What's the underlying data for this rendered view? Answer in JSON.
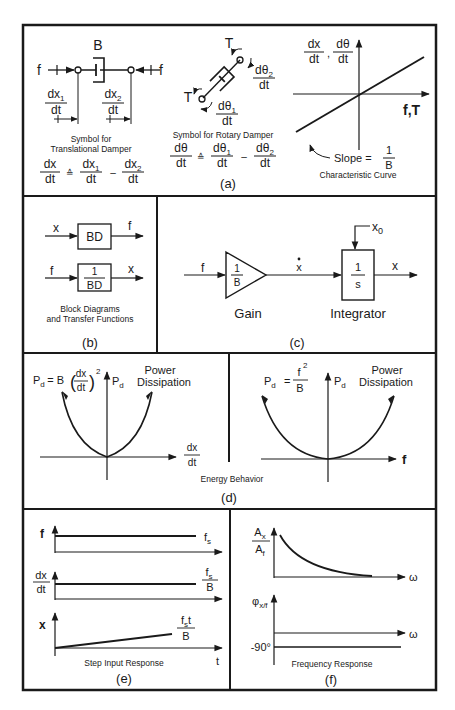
{
  "figure": {
    "panels": {
      "a": {
        "label": "(a)",
        "translational": {
          "damper_label": "B",
          "force_left": "f",
          "force_right": "f",
          "vel1_num": "dx",
          "vel1_sub": "1",
          "vel1_den": "dt",
          "vel2_num": "dx",
          "vel2_sub": "2",
          "vel2_den": "dt",
          "caption_line1": "Symbol for",
          "caption_line2": "Translational Damper",
          "eq_lhs_num": "dx",
          "eq_lhs_den": "dt",
          "eq_sign": "≙",
          "eq_t1_num": "dx",
          "eq_t1_sub": "1",
          "eq_t1_den": "dt",
          "eq_minus": "–",
          "eq_t2_num": "dx",
          "eq_t2_sub": "2",
          "eq_t2_den": "dt"
        },
        "rotary": {
          "torque_top": "T",
          "torque_bottom": "T",
          "vel2_num": "dθ",
          "vel2_sub": "2",
          "vel2_den": "dt",
          "vel1_num": "dθ",
          "vel1_sub": "1",
          "vel1_den": "dt",
          "caption": "Symbol for Rotary Damper",
          "eq_lhs_num": "dθ",
          "eq_lhs_den": "dt",
          "eq_sign": "≙",
          "eq_t1_num": "dθ",
          "eq_t1_sub": "1",
          "eq_t1_den": "dt",
          "eq_minus": "–",
          "eq_t2_num": "dθ",
          "eq_t2_sub": "2",
          "eq_t2_den": "dt"
        },
        "characteristic": {
          "y_num1": "dx",
          "y_den1": "dt",
          "y_sep": ",",
          "y_num2": "dθ",
          "y_den2": "dt",
          "x_label": "f,T",
          "slope_prefix": "Slope =",
          "slope_num": "1",
          "slope_den": "B",
          "caption": "Characteristic Curve"
        }
      },
      "b": {
        "label": "(b)",
        "block1": {
          "input": "x",
          "text": "BD",
          "output": "f"
        },
        "block2": {
          "input": "f",
          "num": "1",
          "den": "BD",
          "output": "x"
        },
        "caption_line1": "Block Diagrams",
        "caption_line2": "and Transfer Functions"
      },
      "c": {
        "label": "(c)",
        "input": "f",
        "gain_num": "1",
        "gain_den": "B",
        "gain_caption": "Gain",
        "mid_signal": "x",
        "integrator_num": "1",
        "integrator_den": "s",
        "integrator_caption": "Integrator",
        "initial_condition": "x",
        "initial_condition_sub": "0",
        "output": "x"
      },
      "d": {
        "label": "(d)",
        "caption": "Energy Behavior",
        "left": {
          "eq_lhs": "P",
          "eq_lhs_sub": "d",
          "eq_rhs_prefix": "= B",
          "eq_num": "dx",
          "eq_den": "dt",
          "eq_exp": "2",
          "y_label": "P",
          "y_sub": "d",
          "title_line1": "Power",
          "title_line2": "Dissipation",
          "x_num": "dx",
          "x_den": "dt"
        },
        "right": {
          "eq_lhs": "P",
          "eq_lhs_sub": "d",
          "eq_eq": "=",
          "eq_num": "f",
          "eq_exp": "2",
          "eq_den": "B",
          "y_label": "P",
          "y_sub": "d",
          "title_line1": "Power",
          "title_line2": "Dissipation",
          "x_label": "f"
        }
      },
      "e": {
        "label": "(e)",
        "caption": "Step Input Response",
        "row1": {
          "y_label": "f",
          "value": "f",
          "value_sub": "s"
        },
        "row2": {
          "y_num": "dx",
          "y_den": "dt",
          "value_num": "f",
          "value_num_sub": "s",
          "value_den": "B"
        },
        "row3": {
          "y_label": "x",
          "value_num": "f",
          "value_num_sub": "s",
          "value_num_suffix": "t",
          "value_den": "B"
        },
        "x_label": "t"
      },
      "f": {
        "label": "(f)",
        "caption": "Frequency Response",
        "amp": {
          "y_num": "A",
          "y_num_sub": "x",
          "y_den": "A",
          "y_den_sub": "f",
          "x_label": "ω"
        },
        "phase": {
          "y_label": "φ",
          "y_sub": "x/f",
          "x_label": "ω",
          "level": "-90°"
        }
      }
    },
    "colors": {
      "ink": "#1a1a1a",
      "background": "#ffffff"
    }
  }
}
